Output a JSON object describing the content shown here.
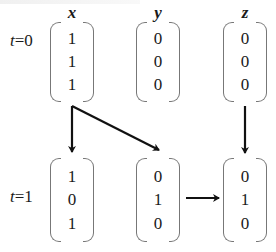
{
  "diagram": {
    "columns": [
      "x",
      "y",
      "z"
    ],
    "rows": [
      {
        "label_var": "t",
        "label_eq": "=0",
        "vectors": {
          "x": [
            "1",
            "1",
            "1"
          ],
          "y": [
            "0",
            "0",
            "0"
          ],
          "z": [
            "0",
            "0",
            "0"
          ]
        }
      },
      {
        "label_var": "t",
        "label_eq": "=1",
        "vectors": {
          "x": [
            "1",
            "0",
            "1"
          ],
          "y": [
            "0",
            "1",
            "0"
          ],
          "z": [
            "0",
            "1",
            "0"
          ]
        }
      }
    ],
    "arrows": [
      {
        "from": "x(t=0)",
        "to": "x(t=1)"
      },
      {
        "from": "x(t=0)",
        "to": "y(t=1)"
      },
      {
        "from": "z(t=0)",
        "to": "z(t=1)"
      },
      {
        "from": "y(t=1)",
        "to": "z(t=1)"
      }
    ],
    "colors": {
      "ink": "#1a1a1a",
      "bracket": "#777777",
      "arrow": "#111111"
    }
  }
}
